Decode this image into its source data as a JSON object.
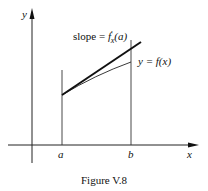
{
  "figure": {
    "caption": "Figure V.8",
    "axes": {
      "x_label": "x",
      "y_label": "y"
    },
    "ticks": {
      "a_label": "a",
      "b_label": "b"
    },
    "annotations": {
      "slope_prefix": "slope = ",
      "slope_func": "f",
      "slope_prime": "′",
      "slope_sub": "x",
      "slope_arg": "(a)",
      "curve_label": "y = f(x)"
    },
    "colors": {
      "ink": "#111111",
      "background": "#ffffff"
    }
  }
}
